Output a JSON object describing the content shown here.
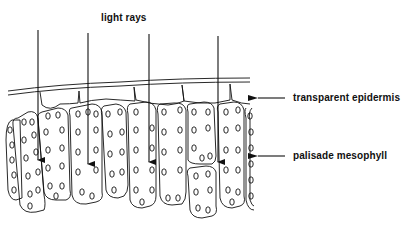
{
  "diagram": {
    "labels": {
      "light_rays": "light rays",
      "epidermis": "transparent epidermis",
      "palisade": "palisade mesophyll"
    },
    "colors": {
      "ink": "#111111",
      "background": "#ffffff"
    },
    "rays": [
      {
        "x": 38,
        "y_start": 30,
        "y_end": 166
      },
      {
        "x": 88,
        "y_start": 33,
        "y_end": 170
      },
      {
        "x": 149,
        "y_start": 34,
        "y_end": 168
      },
      {
        "x": 218,
        "y_start": 36,
        "y_end": 168
      }
    ]
  }
}
